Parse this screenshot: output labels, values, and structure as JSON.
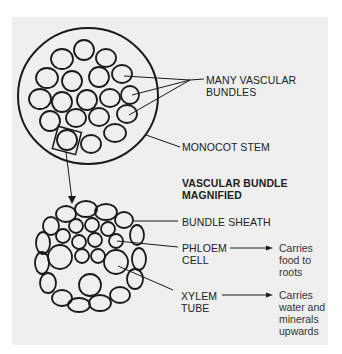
{
  "diagram": {
    "title_magnified": [
      "VASCULAR BUNDLE",
      "MAGNIFIED"
    ],
    "labels": {
      "many_vascular_bundles": [
        "MANY VASCULAR",
        "BUNDLES"
      ],
      "monocot_stem": "MONOCOT STEM",
      "bundle_sheath": "BUNDLE SHEATH",
      "phloem_cell": [
        "PHLOEM",
        "CELL"
      ],
      "xylem_tube": [
        "XYLEM",
        "TUBE"
      ]
    },
    "descriptions": {
      "phloem": [
        "Carries",
        "food to",
        "roots"
      ],
      "xylem": [
        "Carries",
        "water and",
        "minerals",
        "upwards"
      ]
    },
    "colors": {
      "background": "#efefef",
      "stroke": "#1a1a1a"
    }
  }
}
